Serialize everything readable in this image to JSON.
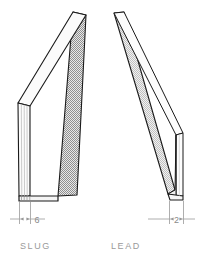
{
  "drawing": {
    "type": "engineering-isometric-plate-diagram",
    "background_color": "#ffffff",
    "outline_color": "#1a1a1a",
    "dimension_line_color": "#808080",
    "caption_color": "#9a9a9a",
    "face_light_color": "#f2f2f2",
    "face_mid_color": "#d9d9d9",
    "face_dark_color": "#a8a8a8",
    "parts": [
      {
        "id": "slug",
        "caption": "SLUG",
        "dimension_value": "6",
        "dimension_units": "",
        "description": "thick plate, leaning right, thickness 6",
        "lean": "top-right"
      },
      {
        "id": "lead",
        "caption": "LEAD",
        "dimension_value": "2",
        "dimension_units": "",
        "description": "thin plate, leaning left, thickness 2",
        "lean": "top-left"
      }
    ]
  },
  "captions": {
    "slug": "SLUG",
    "lead": "LEAD"
  },
  "dimensions": {
    "slug_width": "6",
    "lead_width": "2"
  }
}
